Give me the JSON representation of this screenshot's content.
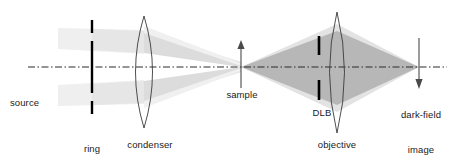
{
  "figure": {
    "kind": "optical-ray-diagram",
    "background_color": "#ffffff",
    "line_color": "#1a1a1a",
    "axis_color": "#333333",
    "beam_light_color": "#d8d8d8",
    "beam_dark_color": "#9d9d9d"
  },
  "labels": {
    "source": "source",
    "ring_aperture_line1": "ring",
    "ring_aperture_line2": "aperture",
    "condenser": "condenser",
    "sample": "sample",
    "dlb": "DLB",
    "objective": "objective",
    "darkfield_line1": "dark-field",
    "darkfield_line2": "image"
  },
  "components": [
    {
      "name": "optical-axis",
      "type": "dash-dot-line",
      "y": 67,
      "x_start": 28,
      "x_end": 447
    },
    {
      "name": "ring-aperture",
      "type": "aperture-bars",
      "x": 92,
      "bars": [
        {
          "y_top": 20,
          "y_bottom": 33
        },
        {
          "y_top": 41,
          "y_bottom": 93
        },
        {
          "y_top": 101,
          "y_bottom": 114
        }
      ]
    },
    {
      "name": "condenser-lens",
      "type": "biconvex-lens",
      "x_center": 144,
      "y_top": 16,
      "y_bottom": 128,
      "half_width": 15
    },
    {
      "name": "sample",
      "type": "up-arrow",
      "x": 241,
      "y_tail": 88,
      "y_head": 42
    },
    {
      "name": "dlb",
      "type": "aperture-bars",
      "x": 319,
      "bars": [
        {
          "y_top": 36,
          "y_bottom": 55
        },
        {
          "y_top": 80,
          "y_bottom": 100
        }
      ]
    },
    {
      "name": "objective-lens",
      "type": "biconvex-lens",
      "x_center": 337,
      "y_top": 12,
      "y_bottom": 133,
      "half_width": 13
    },
    {
      "name": "dark-field-image",
      "type": "down-arrow",
      "x": 419,
      "y_tail": 38,
      "y_head": 88
    }
  ],
  "beams": [
    {
      "name": "source-to-aperture-upper",
      "shade": "very-light",
      "description": "faint band from source region through upper aperture slot to condenser"
    },
    {
      "name": "source-to-aperture-lower",
      "shade": "very-light",
      "description": "faint band from source region through lower aperture slot to condenser"
    },
    {
      "name": "condenser-to-sample-upper",
      "shade": "light",
      "description": "upper converging beam from condenser focusing onto the sample"
    },
    {
      "name": "condenser-to-sample-lower",
      "shade": "light",
      "description": "lower converging beam from condenser focusing onto the sample"
    },
    {
      "name": "sample-to-objective",
      "shade": "dark",
      "description": "scattered cone diverging from sample, widening to fill the objective"
    },
    {
      "name": "objective-to-image",
      "shade": "dark",
      "description": "converging cone from objective forming the dark-field image"
    }
  ]
}
